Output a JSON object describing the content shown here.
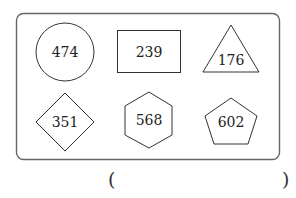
{
  "frame": {
    "stroke": "#666666"
  },
  "shapes": [
    {
      "type": "circle",
      "value": "474"
    },
    {
      "type": "rectangle",
      "value": "239"
    },
    {
      "type": "triangle",
      "value": "176"
    },
    {
      "type": "diamond",
      "value": "351"
    },
    {
      "type": "hexagon",
      "value": "568"
    },
    {
      "type": "pentagon",
      "value": "602"
    }
  ],
  "answer": {
    "open": "(",
    "close": ")",
    "value": ""
  }
}
